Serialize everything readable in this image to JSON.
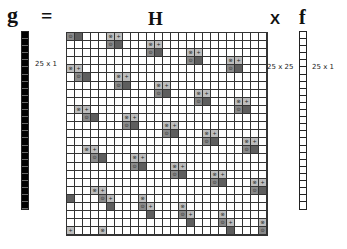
{
  "equation": {
    "g_symbol": "g",
    "equals_symbol": "=",
    "H_symbol": "H",
    "times_symbol": "X",
    "f_symbol": "f"
  },
  "labels": {
    "g_dims": "25 x 1",
    "H_dims": "25 x 25",
    "f_dims": "25 x 1"
  },
  "colors": {
    "g_fill": "#000000",
    "cell_light": "#bdbdbd",
    "cell_dark": "#5e5e5e",
    "grid_line": "#333333"
  },
  "matrix": {
    "rows": 25,
    "cols": 25,
    "glyphs": {
      "x": "⊗",
      "plus": "+",
      "dot": "⊙"
    },
    "cells": [
      [
        0,
        0,
        "dot",
        "mid"
      ],
      [
        0,
        1,
        "",
        "dark"
      ],
      [
        0,
        5,
        "x",
        "light"
      ],
      [
        0,
        6,
        "plus",
        "light"
      ],
      [
        1,
        5,
        "dot",
        "mid"
      ],
      [
        1,
        6,
        "",
        "dark"
      ],
      [
        1,
        10,
        "x",
        "light"
      ],
      [
        1,
        11,
        "plus",
        "light"
      ],
      [
        2,
        10,
        "dot",
        "mid"
      ],
      [
        2,
        11,
        "",
        "dark"
      ],
      [
        2,
        15,
        "x",
        "light"
      ],
      [
        2,
        16,
        "plus",
        "light"
      ],
      [
        3,
        15,
        "dot",
        "mid"
      ],
      [
        3,
        16,
        "",
        "dark"
      ],
      [
        3,
        20,
        "x",
        "light"
      ],
      [
        3,
        21,
        "plus",
        "light"
      ],
      [
        4,
        20,
        "dot",
        "mid"
      ],
      [
        4,
        21,
        "",
        "dark"
      ],
      [
        4,
        0,
        "x",
        "light"
      ],
      [
        4,
        1,
        "plus",
        "light"
      ],
      [
        5,
        1,
        "dot",
        "mid"
      ],
      [
        5,
        2,
        "",
        "dark"
      ],
      [
        5,
        6,
        "x",
        "light"
      ],
      [
        5,
        7,
        "plus",
        "light"
      ],
      [
        6,
        6,
        "dot",
        "mid"
      ],
      [
        6,
        7,
        "",
        "dark"
      ],
      [
        6,
        11,
        "x",
        "light"
      ],
      [
        6,
        12,
        "plus",
        "light"
      ],
      [
        7,
        11,
        "dot",
        "mid"
      ],
      [
        7,
        12,
        "",
        "dark"
      ],
      [
        7,
        16,
        "x",
        "light"
      ],
      [
        7,
        17,
        "plus",
        "light"
      ],
      [
        8,
        16,
        "dot",
        "mid"
      ],
      [
        8,
        17,
        "",
        "dark"
      ],
      [
        8,
        21,
        "x",
        "light"
      ],
      [
        8,
        22,
        "plus",
        "light"
      ],
      [
        9,
        21,
        "dot",
        "mid"
      ],
      [
        9,
        22,
        "",
        "dark"
      ],
      [
        9,
        1,
        "x",
        "light"
      ],
      [
        9,
        2,
        "plus",
        "light"
      ],
      [
        10,
        2,
        "dot",
        "mid"
      ],
      [
        10,
        3,
        "",
        "dark"
      ],
      [
        10,
        7,
        "x",
        "light"
      ],
      [
        10,
        8,
        "plus",
        "light"
      ],
      [
        11,
        7,
        "dot",
        "mid"
      ],
      [
        11,
        8,
        "",
        "dark"
      ],
      [
        11,
        12,
        "x",
        "light"
      ],
      [
        11,
        13,
        "plus",
        "light"
      ],
      [
        12,
        12,
        "dot",
        "mid"
      ],
      [
        12,
        13,
        "",
        "dark"
      ],
      [
        12,
        17,
        "x",
        "light"
      ],
      [
        12,
        18,
        "plus",
        "light"
      ],
      [
        13,
        17,
        "dot",
        "mid"
      ],
      [
        13,
        18,
        "",
        "dark"
      ],
      [
        13,
        22,
        "x",
        "light"
      ],
      [
        13,
        23,
        "plus",
        "light"
      ],
      [
        14,
        22,
        "dot",
        "mid"
      ],
      [
        14,
        23,
        "",
        "dark"
      ],
      [
        14,
        2,
        "x",
        "light"
      ],
      [
        14,
        3,
        "plus",
        "light"
      ],
      [
        15,
        3,
        "dot",
        "mid"
      ],
      [
        15,
        4,
        "",
        "dark"
      ],
      [
        15,
        8,
        "x",
        "light"
      ],
      [
        15,
        9,
        "plus",
        "light"
      ],
      [
        16,
        8,
        "dot",
        "mid"
      ],
      [
        16,
        9,
        "",
        "dark"
      ],
      [
        16,
        13,
        "x",
        "light"
      ],
      [
        16,
        14,
        "plus",
        "light"
      ],
      [
        17,
        13,
        "dot",
        "mid"
      ],
      [
        17,
        14,
        "",
        "dark"
      ],
      [
        17,
        18,
        "x",
        "light"
      ],
      [
        17,
        19,
        "plus",
        "light"
      ],
      [
        18,
        18,
        "dot",
        "mid"
      ],
      [
        18,
        19,
        "",
        "dark"
      ],
      [
        18,
        23,
        "x",
        "light"
      ],
      [
        18,
        24,
        "plus",
        "light"
      ],
      [
        19,
        23,
        "dot",
        "mid"
      ],
      [
        19,
        24,
        "",
        "dark"
      ],
      [
        19,
        3,
        "x",
        "light"
      ],
      [
        19,
        4,
        "plus",
        "light"
      ],
      [
        20,
        4,
        "dot",
        "mid"
      ],
      [
        20,
        5,
        "plus",
        "light"
      ],
      [
        21,
        5,
        "",
        "dark"
      ],
      [
        20,
        0,
        "",
        "dark"
      ],
      [
        20,
        9,
        "x",
        "light"
      ],
      [
        21,
        9,
        "dot",
        "mid"
      ],
      [
        21,
        10,
        "plus",
        "light"
      ],
      [
        22,
        10,
        "",
        "dark"
      ],
      [
        21,
        14,
        "x",
        "light"
      ],
      [
        22,
        14,
        "dot",
        "mid"
      ],
      [
        22,
        15,
        "plus",
        "light"
      ],
      [
        23,
        15,
        "",
        "dark"
      ],
      [
        22,
        19,
        "x",
        "light"
      ],
      [
        23,
        19,
        "dot",
        "mid"
      ],
      [
        23,
        20,
        "plus",
        "light"
      ],
      [
        24,
        20,
        "",
        "dark"
      ],
      [
        23,
        24,
        "x",
        "light"
      ],
      [
        24,
        24,
        "dot",
        "mid"
      ],
      [
        24,
        0,
        "plus",
        "light"
      ],
      [
        24,
        4,
        "x",
        "light"
      ]
    ]
  },
  "vectors": {
    "length": 25
  }
}
